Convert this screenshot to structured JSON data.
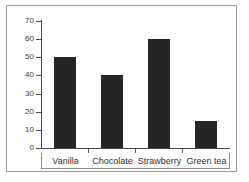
{
  "chart_data": {
    "type": "bar",
    "title": "",
    "xlabel": "",
    "ylabel": "",
    "categories": [
      "Vanilla",
      "Chocolate",
      "Strawberry",
      "Green tea"
    ],
    "values": [
      50,
      40,
      60,
      15
    ],
    "ylim": [
      0,
      70
    ],
    "ytick_values": [
      0,
      10,
      20,
      30,
      40,
      50,
      60,
      70
    ],
    "ytick_labels": [
      "0",
      "10",
      "20",
      "30",
      "40",
      "50",
      "60",
      "70"
    ],
    "grid": false,
    "legend": null,
    "bar_color": "#262626",
    "axis_color": "#4a4a4a",
    "frame_color": "#9a9a9a",
    "background_color": "#ffffff"
  }
}
